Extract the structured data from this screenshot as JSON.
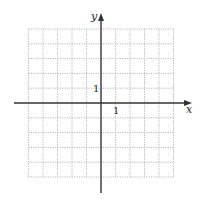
{
  "diagram": {
    "type": "coordinate-grid",
    "axes": {
      "x_label": "x",
      "y_label": "y",
      "x_tick_label": "1",
      "y_tick_label": "1"
    },
    "grid": {
      "columns": 10,
      "rows": 10,
      "x_range": [
        -5,
        5
      ],
      "y_range": [
        -5,
        5
      ],
      "line_style": "dotted"
    },
    "colors": {
      "grid": "#b8b8b8",
      "axis": "#333333",
      "text": "#222222"
    }
  }
}
